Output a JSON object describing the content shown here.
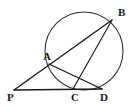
{
  "figure": {
    "width": 136,
    "height": 107,
    "background_color": "#ffffff",
    "stroke_color": "#1a1a1a",
    "circle_stroke_color": "#2a2a2a",
    "label_color": "#161616"
  },
  "chart_data": {
    "type": "diagram",
    "xlabel": "",
    "ylabel": "",
    "grid": false,
    "legend": null,
    "circle": {
      "name": "main-circle",
      "center_x": 84,
      "center_y": 51,
      "radius": 39
    },
    "points": [
      {
        "id": "A",
        "label": "A",
        "x": 49,
        "y": 64,
        "label_x": 43,
        "label_y": 60,
        "on_circle": true
      },
      {
        "id": "B",
        "label": "B",
        "x": 112,
        "y": 20,
        "label_x": 118,
        "label_y": 16,
        "on_circle": true
      },
      {
        "id": "C",
        "label": "C",
        "x": 73,
        "y": 89,
        "label_x": 71,
        "label_y": 101,
        "on_circle": true
      },
      {
        "id": "D",
        "label": "D",
        "x": 102,
        "y": 89,
        "label_x": 100,
        "label_y": 101,
        "on_circle": true
      },
      {
        "id": "P",
        "label": "P",
        "x": 14,
        "y": 90,
        "label_x": 7,
        "label_y": 101,
        "on_circle": false
      }
    ],
    "segments": [
      {
        "name": "secant-P-A-B",
        "from": "P",
        "to": "B",
        "through": "A"
      },
      {
        "name": "secant-P-C-D",
        "from": "P",
        "to": "D",
        "through": "C"
      },
      {
        "name": "chord-A-D",
        "from": "A",
        "to": "D",
        "through": null
      },
      {
        "name": "chord-C-B",
        "from": "C",
        "to": "B",
        "through": null
      }
    ]
  }
}
